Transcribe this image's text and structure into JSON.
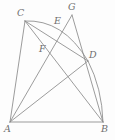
{
  "figure": {
    "background_color": "#fdfdfd",
    "stroke_color": "#8a8a8a",
    "label_color": "#6f6f6f",
    "canvas": {
      "width": 115,
      "height": 140
    },
    "points": [
      {
        "id": "A",
        "label": "A",
        "x": 10,
        "y": 122,
        "label_x": 4,
        "label_y": 124
      },
      {
        "id": "B",
        "label": "B",
        "x": 103,
        "y": 122,
        "label_x": 101,
        "label_y": 124
      },
      {
        "id": "C",
        "label": "C",
        "x": 25,
        "y": 21,
        "label_x": 17,
        "label_y": 8
      },
      {
        "id": "D",
        "label": "D",
        "x": 88,
        "y": 61,
        "label_x": 89,
        "label_y": 50
      },
      {
        "id": "E",
        "label": "E",
        "x": 61,
        "y": 28,
        "label_x": 54,
        "label_y": 16
      },
      {
        "id": "F",
        "label": "F",
        "x": 48,
        "y": 54,
        "label_x": 39,
        "label_y": 44
      },
      {
        "id": "G",
        "label": "G",
        "x": 72,
        "y": 15,
        "label_x": 68,
        "label_y": 2
      }
    ],
    "segments": [
      {
        "id": "AB",
        "from": "A",
        "to": "B",
        "name": "segment-a-b"
      },
      {
        "id": "AC",
        "from": "A",
        "to": "C",
        "name": "segment-a-c"
      },
      {
        "id": "AG",
        "from": "A",
        "to": "G",
        "name": "segment-a-g"
      },
      {
        "id": "AD",
        "from": "A",
        "to": "D",
        "name": "segment-a-d"
      },
      {
        "id": "CB",
        "from": "C",
        "to": "B",
        "name": "segment-c-b"
      },
      {
        "id": "CD",
        "from": "C",
        "to": "D",
        "name": "segment-c-d"
      },
      {
        "id": "GB",
        "from": "G",
        "to": "B",
        "name": "segment-g-b"
      }
    ],
    "arcs": [
      {
        "id": "arc-CED",
        "from": "C",
        "through": "E",
        "to": "D",
        "name": "arc-c-e-d"
      },
      {
        "id": "arc-DB",
        "from": "D",
        "through": null,
        "to": "B",
        "name": "arc-d-b"
      }
    ]
  }
}
